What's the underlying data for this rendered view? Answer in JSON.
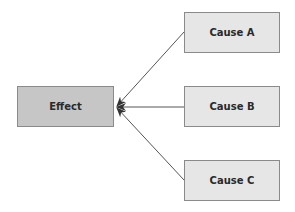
{
  "diagram": {
    "effect": {
      "label": "Effect",
      "fill": "#c6c6c6"
    },
    "causes": [
      {
        "label": "Cause A",
        "fill": "#e6e6e6"
      },
      {
        "label": "Cause B",
        "fill": "#e6e6e6"
      },
      {
        "label": "Cause C",
        "fill": "#e6e6e6"
      }
    ],
    "edges": [
      {
        "from": "Cause A",
        "to": "Effect"
      },
      {
        "from": "Cause B",
        "to": "Effect"
      },
      {
        "from": "Cause C",
        "to": "Effect"
      }
    ],
    "line_color": "#555555"
  }
}
